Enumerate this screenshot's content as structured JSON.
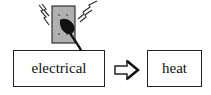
{
  "diagram": {
    "type": "energy-transformation",
    "source": {
      "label": "electrical",
      "icon": "wall-outlet-with-plug-icon"
    },
    "arrow": {
      "icon": "right-arrow-icon",
      "style": "hollow"
    },
    "target": {
      "label": "heat"
    }
  },
  "colors": {
    "stroke": "#222222",
    "outlet_fill": "#b0b0b0",
    "plug_fill": "#111111",
    "background": "#ffffff"
  }
}
